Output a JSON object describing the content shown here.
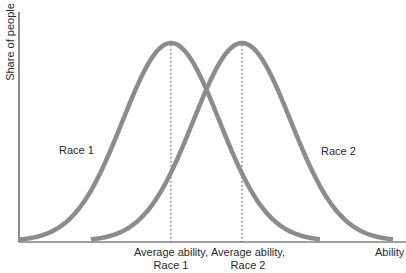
{
  "chart_data": {
    "type": "line",
    "title": "",
    "xlabel": "Ability",
    "ylabel": "Share of people",
    "grid": false,
    "legend": "inline labels",
    "series": [
      {
        "name": "Race 1",
        "shape": "bell curve",
        "mean_label": "Average ability, Race 1",
        "peak_x_px": 171,
        "start_x_px": 20,
        "end_x_px": 320
      },
      {
        "name": "Race 2",
        "shape": "bell curve",
        "mean_label": "Average ability, Race 2",
        "peak_x_px": 242,
        "start_x_px": 91,
        "end_x_px": 393
      }
    ],
    "annotations": [
      "Average ability, Race 1",
      "Average ability, Race 2"
    ],
    "curve_color": "#8c8c8c",
    "axis_color": "#333333"
  },
  "labels": {
    "y_axis": "Share of people",
    "x_axis": "Ability",
    "race1": "Race 1",
    "race2": "Race 2",
    "avg1_line1": "Average ability,",
    "avg1_line2": "Race 1",
    "avg2_line1": "Average ability,",
    "avg2_line2": "Race 2"
  }
}
